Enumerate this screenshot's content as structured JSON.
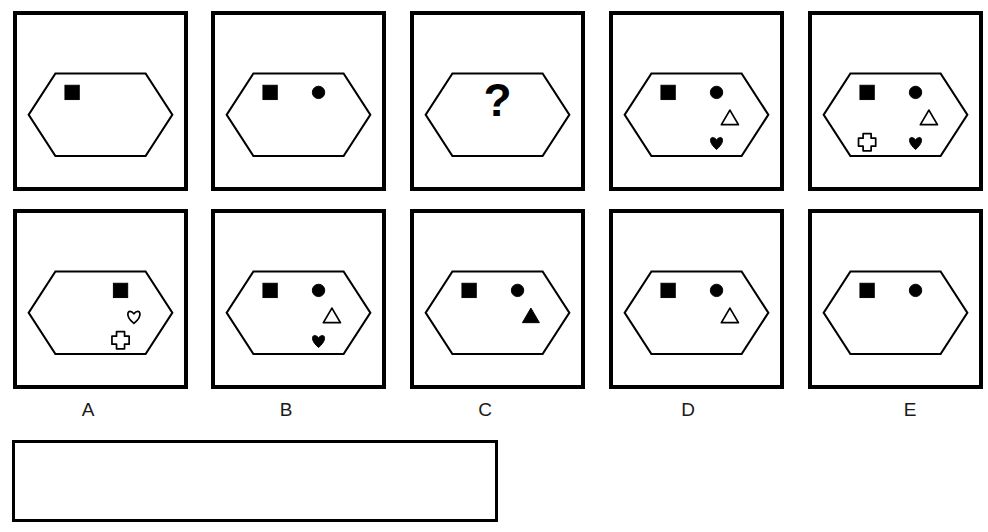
{
  "puzzle": {
    "type": "figural-matrix-multiple-choice",
    "question_mark": "?",
    "stimulus_panels": [
      {
        "id": "stimulus-1",
        "position": 1,
        "container": "hexagon",
        "shapes": [
          {
            "name": "square",
            "fill": "filled",
            "slot": "top-left"
          }
        ]
      },
      {
        "id": "stimulus-2",
        "position": 2,
        "container": "hexagon",
        "shapes": [
          {
            "name": "square",
            "fill": "filled",
            "slot": "top-left"
          },
          {
            "name": "circle",
            "fill": "filled",
            "slot": "top-right"
          }
        ]
      },
      {
        "id": "stimulus-3-missing",
        "position": 3,
        "container": "hexagon",
        "shapes": [],
        "missing": true
      },
      {
        "id": "stimulus-4",
        "position": 4,
        "container": "hexagon",
        "shapes": [
          {
            "name": "square",
            "fill": "filled",
            "slot": "top-left"
          },
          {
            "name": "circle",
            "fill": "filled",
            "slot": "top-right"
          },
          {
            "name": "triangle",
            "fill": "outline",
            "slot": "middle-right"
          },
          {
            "name": "heart",
            "fill": "filled",
            "slot": "bottom-right"
          }
        ]
      },
      {
        "id": "stimulus-5",
        "position": 5,
        "container": "hexagon",
        "shapes": [
          {
            "name": "square",
            "fill": "filled",
            "slot": "top-left"
          },
          {
            "name": "circle",
            "fill": "filled",
            "slot": "top-right"
          },
          {
            "name": "triangle",
            "fill": "outline",
            "slot": "middle-right"
          },
          {
            "name": "cross",
            "fill": "outline",
            "slot": "bottom-left"
          },
          {
            "name": "heart",
            "fill": "filled",
            "slot": "bottom-right"
          }
        ]
      }
    ],
    "options": [
      {
        "label": "A",
        "id": "option-a",
        "container": "hexagon",
        "shapes": [
          {
            "name": "square",
            "fill": "filled",
            "slot": "top-right"
          },
          {
            "name": "heart",
            "fill": "outline",
            "slot": "middle-right"
          },
          {
            "name": "cross",
            "fill": "outline",
            "slot": "bottom-right"
          }
        ]
      },
      {
        "label": "B",
        "id": "option-b",
        "container": "hexagon",
        "shapes": [
          {
            "name": "square",
            "fill": "filled",
            "slot": "top-left"
          },
          {
            "name": "circle",
            "fill": "filled",
            "slot": "top-right"
          },
          {
            "name": "triangle",
            "fill": "outline",
            "slot": "middle-right"
          },
          {
            "name": "heart",
            "fill": "filled",
            "slot": "bottom-right"
          }
        ]
      },
      {
        "label": "C",
        "id": "option-c",
        "container": "hexagon",
        "shapes": [
          {
            "name": "square",
            "fill": "filled",
            "slot": "top-left"
          },
          {
            "name": "circle",
            "fill": "filled",
            "slot": "top-right"
          },
          {
            "name": "triangle",
            "fill": "filled",
            "slot": "middle-right"
          }
        ]
      },
      {
        "label": "D",
        "id": "option-d",
        "container": "hexagon",
        "shapes": [
          {
            "name": "square",
            "fill": "filled",
            "slot": "top-left"
          },
          {
            "name": "circle",
            "fill": "filled",
            "slot": "top-right"
          },
          {
            "name": "triangle",
            "fill": "outline",
            "slot": "middle-right"
          }
        ]
      },
      {
        "label": "E",
        "id": "option-e",
        "container": "hexagon",
        "shapes": [
          {
            "name": "square",
            "fill": "filled",
            "slot": "top-left"
          },
          {
            "name": "circle",
            "fill": "filled",
            "slot": "top-right"
          }
        ]
      }
    ],
    "answer_box": {
      "id": "answer-box",
      "value": "",
      "placeholder": ""
    },
    "colors": {
      "ink": "#000000",
      "background": "#ffffff",
      "label_text": "#1a1a1a"
    }
  }
}
